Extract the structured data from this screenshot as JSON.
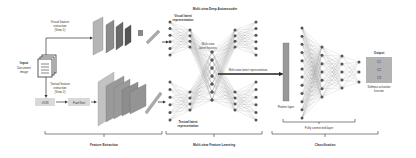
{
  "input": {
    "title": "Input",
    "subtitle_line1": "Document",
    "subtitle_line2": "image"
  },
  "visual_branch": {
    "line1": "Visual feature",
    "line2": "extraction",
    "line3": "(View 1)"
  },
  "textual_branch": {
    "line1": "Textual feature",
    "line2": "extraction",
    "line3": "(View 2)"
  },
  "ocr_label": "OCR",
  "fasttext_label": "FastText",
  "autoencoder_title": "Multi-view Deep Autoencoder",
  "visual_latent": {
    "line1": "Visual latent",
    "line2": "representation"
  },
  "textual_latent": {
    "line1": "Textual latent",
    "line2": "representation"
  },
  "multiview_features": {
    "line1": "Multi-view",
    "line2": "latent features"
  },
  "multiview_rep_label": "Multi-view latent representation",
  "flatten_label": "Flatten layer",
  "output_title": "Output",
  "output_classes": [
    "C1",
    "C2",
    "C3"
  ],
  "softmax": {
    "line1": "Softmax activation",
    "line2": "function"
  },
  "fc_label": "Fully connected layer",
  "sections": {
    "feature_extraction": "Feature Extraction",
    "multiview_learning": "Multi-view Feature Learning",
    "classification": "Classification"
  },
  "colors": {
    "line": "#333333",
    "node": "#555555",
    "layer_dark": "#5a5a5a",
    "layer_light": "#a8a8a8",
    "box": "#d9d9d9"
  }
}
